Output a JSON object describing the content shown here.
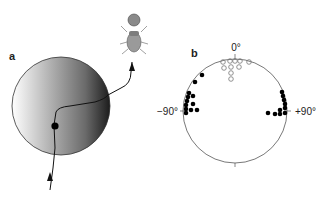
{
  "panel_a": {
    "label": "a",
    "description": "Beetle path crossing a shaded disc (light on left, dark on right)"
  },
  "panel_b": {
    "label": "b",
    "top_label": "0°",
    "left_label": "−90°",
    "right_label": "+90°",
    "legend": {
      "open_circles": "headings near 0°",
      "filled_circles": "headings near ±90°"
    }
  }
}
